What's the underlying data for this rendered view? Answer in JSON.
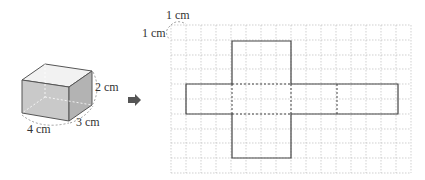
{
  "box": {
    "labels": {
      "width": "4 cm",
      "depth": "3 cm",
      "height": "2 cm"
    },
    "colors": {
      "top": "#f2f2f2",
      "front": "#c9c9c9",
      "side": "#b3b3b3",
      "edge": "#555555"
    }
  },
  "arrow": {
    "icon": "right-arrow-icon",
    "color": "#555555"
  },
  "grid": {
    "unit_label_x": "1 cm",
    "unit_label_y": "1 cm",
    "columns": 16,
    "rows": 10,
    "line_color": "#bbbbbb",
    "net_color": "#444444"
  }
}
